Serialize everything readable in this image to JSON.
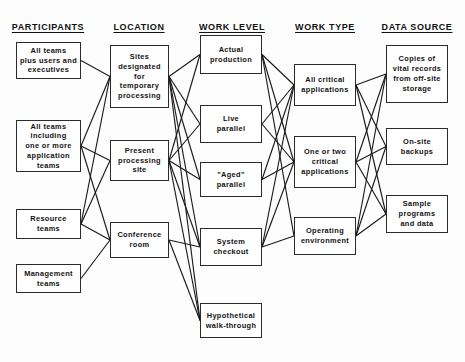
{
  "diagram": {
    "canvas": {
      "width": 465,
      "height": 362,
      "background": "#fdfdfd"
    },
    "style": {
      "box_border": "#2b2b2b",
      "box_fill": "#ffffff",
      "edge_color": "#1a1a1a",
      "text_color": "#121212"
    },
    "columns": [
      {
        "id": "participants",
        "header": "PARTICIPANTS",
        "cx": 48
      },
      {
        "id": "location",
        "header": "LOCATION",
        "cx": 139
      },
      {
        "id": "work_level",
        "header": "WORK LEVEL",
        "cx": 232
      },
      {
        "id": "work_type",
        "header": "WORK TYPE",
        "cx": 325
      },
      {
        "id": "data_source",
        "header": "DATA SOURCE",
        "cx": 417
      }
    ],
    "header_y": 22,
    "nodes": [
      {
        "id": "p1",
        "column": "participants",
        "label": "All teams\nplus users and\nexecutives",
        "x": 16,
        "y": 42,
        "w": 65,
        "h": 37
      },
      {
        "id": "p2",
        "column": "participants",
        "label": "All teams\nincluding\none or more\napplication\nteams",
        "x": 16,
        "y": 120,
        "w": 65,
        "h": 52
      },
      {
        "id": "p3",
        "column": "participants",
        "label": "Resource\nteams",
        "x": 16,
        "y": 209,
        "w": 65,
        "h": 30
      },
      {
        "id": "p4",
        "column": "participants",
        "label": "Management\nteams",
        "x": 16,
        "y": 264,
        "w": 65,
        "h": 29
      },
      {
        "id": "l1",
        "column": "location",
        "label": "Sites\ndesignated for\ntemporary\nprocessing",
        "x": 110,
        "y": 45,
        "w": 59,
        "h": 63
      },
      {
        "id": "l2",
        "column": "location",
        "label": "Present\nprocessing\nsite",
        "x": 110,
        "y": 140,
        "w": 59,
        "h": 41
      },
      {
        "id": "l3",
        "column": "location",
        "label": "Conference\nroom",
        "x": 110,
        "y": 222,
        "w": 59,
        "h": 36
      },
      {
        "id": "w1",
        "column": "work_level",
        "label": "Actual\nproduction",
        "x": 200,
        "y": 35,
        "w": 62,
        "h": 39
      },
      {
        "id": "w2",
        "column": "work_level",
        "label": "Live\nparallel",
        "x": 200,
        "y": 105,
        "w": 62,
        "h": 38
      },
      {
        "id": "w3",
        "column": "work_level",
        "label": "\"Aged\"\nparallel",
        "x": 200,
        "y": 162,
        "w": 62,
        "h": 35
      },
      {
        "id": "w4",
        "column": "work_level",
        "label": "System\ncheckout",
        "x": 200,
        "y": 228,
        "w": 62,
        "h": 38
      },
      {
        "id": "w5",
        "column": "work_level",
        "label": "Hypothetical\nwalk-through",
        "x": 200,
        "y": 303,
        "w": 62,
        "h": 35
      },
      {
        "id": "t1",
        "column": "work_type",
        "label": "All critical\napplications",
        "x": 294,
        "y": 64,
        "w": 62,
        "h": 42
      },
      {
        "id": "t2",
        "column": "work_type",
        "label": "One or two\ncritical\napplications",
        "x": 294,
        "y": 136,
        "w": 62,
        "h": 52
      },
      {
        "id": "t3",
        "column": "work_type",
        "label": "Operating\nenvironment",
        "x": 294,
        "y": 217,
        "w": 62,
        "h": 38
      },
      {
        "id": "d1",
        "column": "data_source",
        "label": "Copies of\nvital records\nfrom off-site\nstorage",
        "x": 386,
        "y": 45,
        "w": 62,
        "h": 58
      },
      {
        "id": "d2",
        "column": "data_source",
        "label": "On-site\nbackups",
        "x": 386,
        "y": 128,
        "w": 62,
        "h": 37
      },
      {
        "id": "d3",
        "column": "data_source",
        "label": "Sample\nprograms\nand data",
        "x": 386,
        "y": 195,
        "w": 62,
        "h": 38
      }
    ],
    "edges": [
      {
        "from": "p1",
        "to": "l1"
      },
      {
        "from": "p2",
        "to": "l1"
      },
      {
        "from": "p2",
        "to": "l2"
      },
      {
        "from": "p2",
        "to": "l3"
      },
      {
        "from": "p3",
        "to": "l1"
      },
      {
        "from": "p3",
        "to": "l2"
      },
      {
        "from": "p3",
        "to": "l3"
      },
      {
        "from": "p4",
        "to": "l3"
      },
      {
        "from": "l1",
        "to": "w1"
      },
      {
        "from": "l1",
        "to": "w2"
      },
      {
        "from": "l1",
        "to": "w3"
      },
      {
        "from": "l1",
        "to": "w4"
      },
      {
        "from": "l1",
        "to": "w5"
      },
      {
        "from": "l2",
        "to": "w1"
      },
      {
        "from": "l2",
        "to": "w2"
      },
      {
        "from": "l2",
        "to": "w3"
      },
      {
        "from": "l2",
        "to": "w4"
      },
      {
        "from": "l2",
        "to": "w5"
      },
      {
        "from": "l3",
        "to": "w4"
      },
      {
        "from": "l3",
        "to": "w5"
      },
      {
        "from": "w1",
        "to": "t1"
      },
      {
        "from": "w1",
        "to": "t2"
      },
      {
        "from": "w1",
        "to": "t3"
      },
      {
        "from": "w2",
        "to": "t1"
      },
      {
        "from": "w2",
        "to": "t2"
      },
      {
        "from": "w3",
        "to": "t1"
      },
      {
        "from": "w3",
        "to": "t2"
      },
      {
        "from": "w4",
        "to": "t1"
      },
      {
        "from": "w4",
        "to": "t2"
      },
      {
        "from": "w4",
        "to": "t3"
      },
      {
        "from": "t1",
        "to": "d1"
      },
      {
        "from": "t1",
        "to": "d2"
      },
      {
        "from": "t1",
        "to": "d3"
      },
      {
        "from": "t2",
        "to": "d1"
      },
      {
        "from": "t2",
        "to": "d2"
      },
      {
        "from": "t2",
        "to": "d3"
      },
      {
        "from": "t3",
        "to": "d1"
      },
      {
        "from": "t3",
        "to": "d2"
      },
      {
        "from": "t3",
        "to": "d3"
      }
    ]
  }
}
